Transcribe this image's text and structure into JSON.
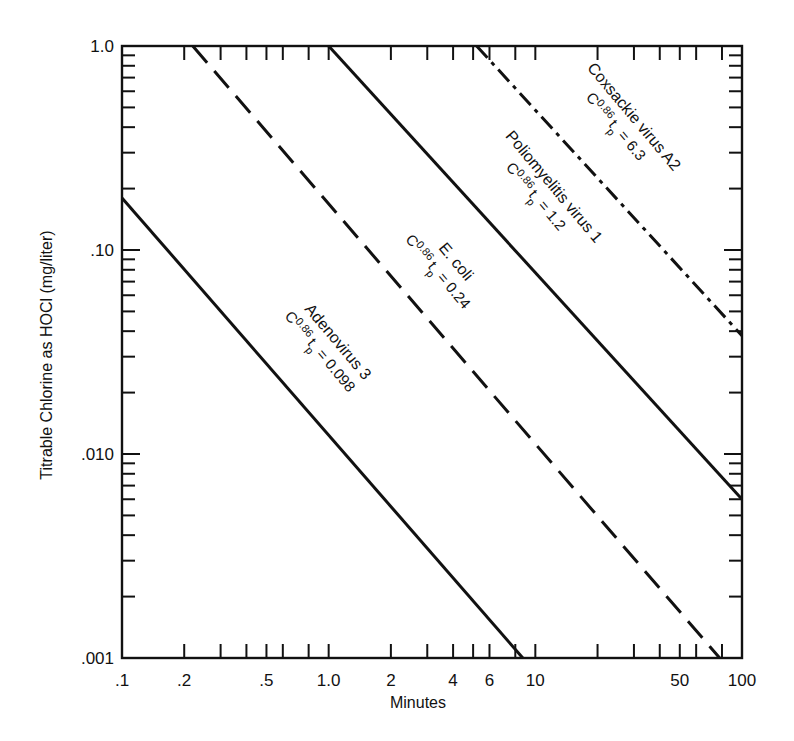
{
  "chart_data": {
    "type": "line",
    "title": "",
    "xlabel": "Minutes",
    "ylabel": "Titrable Chlorine as HOCl (mg/liter)",
    "xscale": "log",
    "yscale": "log",
    "xlim": [
      0.1,
      100
    ],
    "ylim": [
      0.001,
      1.0
    ],
    "grid": false,
    "legend": "inline labels along lines",
    "x_tick_labels": [
      {
        "value": 0.1,
        "label": ".1"
      },
      {
        "value": 0.2,
        "label": ".2"
      },
      {
        "value": 0.5,
        "label": ".5"
      },
      {
        "value": 1.0,
        "label": "1.0"
      },
      {
        "value": 2,
        "label": "2"
      },
      {
        "value": 4,
        "label": "4"
      },
      {
        "value": 6,
        "label": "6"
      },
      {
        "value": 10,
        "label": "10"
      },
      {
        "value": 50,
        "label": "50"
      },
      {
        "value": 100,
        "label": "100"
      }
    ],
    "y_tick_labels": [
      {
        "value": 1.0,
        "label": "1.0"
      },
      {
        "value": 0.1,
        "label": ".10"
      },
      {
        "value": 0.01,
        "label": ".010"
      },
      {
        "value": 0.001,
        "label": ".001"
      }
    ],
    "series": [
      {
        "name": "Adenovirus 3",
        "formula_prefix": "C",
        "exponent": "0.86",
        "formula_t": "t",
        "formula_sub": "p",
        "formula_value": "= 0.098",
        "k": 0.098,
        "style": "solid",
        "points": [
          [
            0.1,
            0.18
          ],
          [
            8.7,
            0.001
          ]
        ]
      },
      {
        "name": "E. coli",
        "formula_prefix": "C",
        "exponent": "0.86",
        "formula_t": "t",
        "formula_sub": "p",
        "formula_value": "= 0.24",
        "k": 0.24,
        "style": "dashed",
        "points": [
          [
            0.22,
            1.0
          ],
          [
            78,
            0.001
          ]
        ]
      },
      {
        "name": "Poliomyelitis virus 1",
        "formula_prefix": "C",
        "exponent": "0.86",
        "formula_t": "t",
        "formula_sub": "p",
        "formula_value": "= 1.2",
        "k": 1.2,
        "style": "solid",
        "points": [
          [
            1.0,
            1.0
          ],
          [
            100,
            0.006
          ]
        ]
      },
      {
        "name": "Coxsackie virus A2",
        "formula_prefix": "C",
        "exponent": "0.86",
        "formula_t": "t",
        "formula_sub": "p",
        "formula_value": "= 6.3",
        "k": 6.3,
        "style": "dashdot",
        "points": [
          [
            5.2,
            1.0
          ],
          [
            100,
            0.038
          ]
        ]
      }
    ]
  }
}
